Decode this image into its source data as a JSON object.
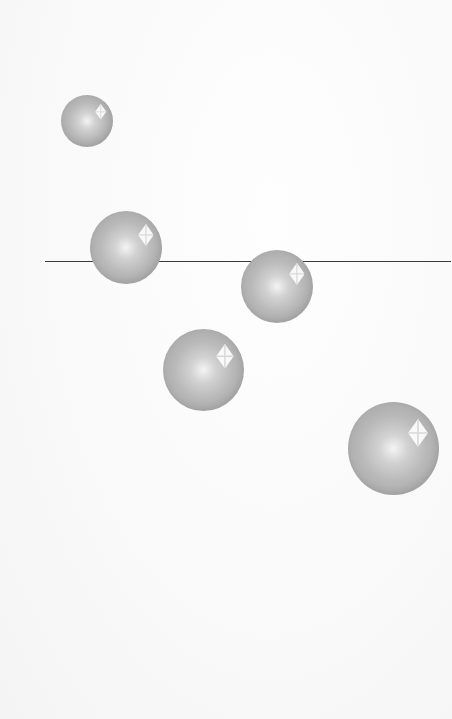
{
  "scene": {
    "description": "Five glossy grey spheres on a pale background with a thin horizontal line passing behind two of them",
    "background_color": "#fcfcfc",
    "line_color": "#3a3a3a",
    "sphere_color": "#b9b9b9",
    "highlight_color": "#ffffff",
    "sphere_count": 5
  },
  "spheres": [
    {
      "label": "sphere-1"
    },
    {
      "label": "sphere-2"
    },
    {
      "label": "sphere-3"
    },
    {
      "label": "sphere-4"
    },
    {
      "label": "sphere-5"
    }
  ]
}
